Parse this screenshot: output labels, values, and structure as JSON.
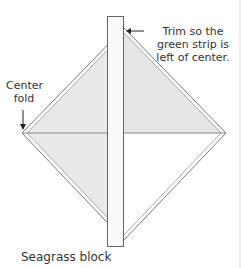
{
  "diagram": {
    "annotations": {
      "trim_note": "Trim so the green strip is left of center.",
      "center_fold": "Center fold"
    },
    "caption": "Seagrass block",
    "colors": {
      "outline": "#888888",
      "fill": "#e6e6e6",
      "strip_fill": "#fafafa",
      "strip_outline": "#666666",
      "arrow": "#222222",
      "border_right": "#dddddd"
    }
  }
}
